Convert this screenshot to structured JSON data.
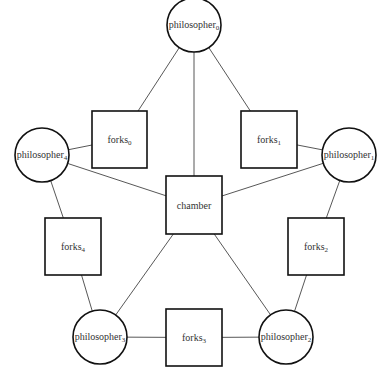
{
  "diagram": {
    "colors": {
      "stroke": "#111111",
      "edge": "#444444",
      "text": "#333333",
      "background": "#ffffff"
    },
    "philosophers": [
      {
        "id": "p0",
        "base": "philosopher",
        "sub": "0",
        "cx": 194,
        "cy": 25,
        "r": 27
      },
      {
        "id": "p1",
        "base": "philosopher",
        "sub": "1",
        "cx": 349,
        "cy": 155,
        "r": 27
      },
      {
        "id": "p2",
        "base": "philosopher",
        "sub": "2",
        "cx": 286,
        "cy": 337,
        "r": 27
      },
      {
        "id": "p3",
        "base": "philosopher",
        "sub": "3",
        "cx": 100,
        "cy": 337,
        "r": 27
      },
      {
        "id": "p4",
        "base": "philosopher",
        "sub": "4",
        "cx": 42,
        "cy": 155,
        "r": 27
      }
    ],
    "forks": [
      {
        "id": "f0",
        "base": "forks",
        "sub": "0",
        "x": 92,
        "y": 111,
        "w": 55,
        "h": 57
      },
      {
        "id": "f1",
        "base": "forks",
        "sub": "1",
        "x": 241,
        "y": 111,
        "w": 56,
        "h": 57
      },
      {
        "id": "f2",
        "base": "forks",
        "sub": "2",
        "x": 288,
        "y": 218,
        "w": 56,
        "h": 57
      },
      {
        "id": "f3",
        "base": "forks",
        "sub": "3",
        "x": 166,
        "y": 309,
        "w": 56,
        "h": 57
      },
      {
        "id": "f4",
        "base": "forks",
        "sub": "4",
        "x": 45,
        "y": 218,
        "w": 56,
        "h": 57
      }
    ],
    "chamber": {
      "id": "chamber",
      "label": "chamber",
      "x": 166,
      "y": 176,
      "w": 56,
      "h": 58
    },
    "edges": [
      [
        "p0",
        "f0"
      ],
      [
        "p0",
        "f1"
      ],
      [
        "p0",
        "chamber"
      ],
      [
        "p1",
        "f1"
      ],
      [
        "p1",
        "f2"
      ],
      [
        "p1",
        "chamber"
      ],
      [
        "p2",
        "f2"
      ],
      [
        "p2",
        "f3"
      ],
      [
        "p2",
        "chamber"
      ],
      [
        "p3",
        "f3"
      ],
      [
        "p3",
        "f4"
      ],
      [
        "p3",
        "chamber"
      ],
      [
        "p4",
        "f4"
      ],
      [
        "p4",
        "f0"
      ],
      [
        "p4",
        "chamber"
      ]
    ]
  }
}
